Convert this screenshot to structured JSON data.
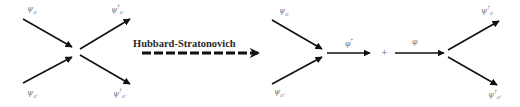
{
  "diagram": {
    "transform_label": "Hubbard-Stratonovich",
    "plus_sign": "+",
    "left_vertex": {
      "in_top": {
        "base": "ψ",
        "sub": "σ",
        "sup": ""
      },
      "in_bottom": {
        "base": "ψ",
        "sub": "σ'",
        "sup": ""
      },
      "out_top": {
        "base": "ψ",
        "sub": "σ",
        "sup": "†"
      },
      "out_bottom": {
        "base": "ψ",
        "sub": "σ'",
        "sup": "†"
      }
    },
    "right_left_vertex": {
      "in_top": {
        "base": "ψ",
        "sub": "σ",
        "sup": ""
      },
      "in_bottom": {
        "base": "ψ",
        "sub": "σ'",
        "sup": ""
      },
      "out": {
        "base": "φ",
        "sub": "",
        "sup": "*"
      }
    },
    "right_right_vertex": {
      "in": {
        "base": "φ",
        "sub": "",
        "sup": ""
      },
      "out_top": {
        "base": "ψ",
        "sub": "σ",
        "sup": "†"
      },
      "out_bottom": {
        "base": "ψ",
        "sub": "σ'",
        "sup": "†"
      }
    },
    "colors": {
      "line": "#111111",
      "label": "#777777"
    }
  }
}
